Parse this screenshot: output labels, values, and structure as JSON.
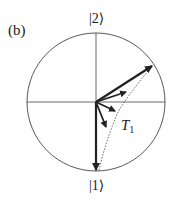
{
  "figure": {
    "panel_label": "(b)",
    "state_top": "|2⟩",
    "state_bottom": "|1⟩",
    "time_label_main": "T",
    "time_label_sub": "1",
    "colors": {
      "stroke": "#222222",
      "background": "#ffffff"
    }
  }
}
